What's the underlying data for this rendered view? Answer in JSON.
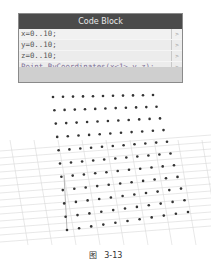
{
  "node": {
    "title": "Code Block",
    "lines": [
      {
        "text": "x=0..10;",
        "port": ">"
      },
      {
        "text": "y=0..10;",
        "port": ">"
      },
      {
        "text": "z=0..10;",
        "port": ">"
      },
      {
        "text": "Point.ByCoordinates(x<1>,y,z);",
        "port": ">"
      }
    ]
  },
  "viewport": {
    "description": "3D preview of an 11x11 grid of points over a ground grid",
    "grid_columns": 11,
    "grid_rows": 11,
    "point_color": "#333333",
    "grid_line_color": "#d9d9d9"
  },
  "caption": {
    "label": "图",
    "number": "3-13"
  }
}
